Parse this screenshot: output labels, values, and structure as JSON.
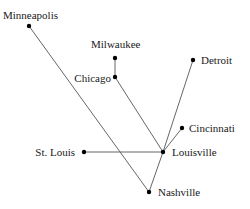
{
  "diagram": {
    "type": "network-map",
    "colors": {
      "edge": "#555555",
      "node": "#000000",
      "text": "#1a1a1a",
      "background": "#ffffff"
    },
    "nodes": [
      {
        "id": "minneapolis",
        "label": "Minneapolis",
        "x": 29,
        "y": 26,
        "lx": 3,
        "ly": 19,
        "anchor": "start"
      },
      {
        "id": "milwaukee",
        "label": "Milwaukee",
        "x": 115,
        "y": 58,
        "lx": 91,
        "ly": 48,
        "anchor": "start"
      },
      {
        "id": "chicago",
        "label": "Chicago",
        "x": 115,
        "y": 77,
        "lx": 111,
        "ly": 82,
        "anchor": "end"
      },
      {
        "id": "detroit",
        "label": "Detroit",
        "x": 193,
        "y": 60,
        "lx": 201,
        "ly": 64,
        "anchor": "start"
      },
      {
        "id": "cincinnati",
        "label": "Cincinnati",
        "x": 182,
        "y": 128,
        "lx": 189,
        "ly": 132,
        "anchor": "start"
      },
      {
        "id": "louisville",
        "label": "Louisville",
        "x": 163,
        "y": 152,
        "lx": 172,
        "ly": 156,
        "anchor": "start"
      },
      {
        "id": "stlouis",
        "label": "St. Louis",
        "x": 84,
        "y": 152,
        "lx": 75,
        "ly": 156,
        "anchor": "end"
      },
      {
        "id": "nashville",
        "label": "Nashville",
        "x": 149,
        "y": 192,
        "lx": 158,
        "ly": 196,
        "anchor": "start"
      }
    ],
    "edges": [
      [
        "minneapolis",
        "nashville"
      ],
      [
        "milwaukee",
        "chicago"
      ],
      [
        "chicago",
        "louisville"
      ],
      [
        "detroit",
        "louisville"
      ],
      [
        "cincinnati",
        "louisville"
      ],
      [
        "stlouis",
        "louisville"
      ],
      [
        "louisville",
        "nashville"
      ]
    ]
  }
}
